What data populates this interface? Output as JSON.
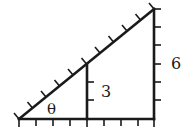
{
  "diagram": {
    "type": "similar-right-triangles",
    "labels": {
      "angle": "θ",
      "small_height": "3",
      "large_height": "6"
    },
    "colors": {
      "stroke": "#1a1a1a",
      "background": "#ffffff"
    },
    "geometry": {
      "left_vertex": [
        19,
        119
      ],
      "middle_base": [
        87,
        119
      ],
      "middle_top": [
        87,
        64
      ],
      "right_base": [
        154,
        119
      ],
      "apex": [
        154,
        9
      ],
      "base_ticks": 6,
      "hypotenuse_ticks": 10,
      "small_height_ticks": 3,
      "large_height_ticks": 6
    }
  }
}
